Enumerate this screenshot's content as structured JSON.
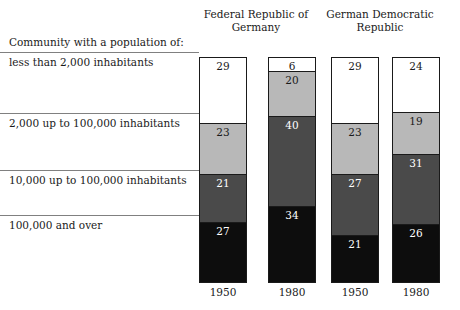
{
  "chart_data": {
    "type": "bar",
    "subtype": "stacked-column-100pct",
    "title": "",
    "xlabel": "",
    "ylabel": "",
    "ylim": [
      0,
      100
    ],
    "grid": false,
    "legend_position": "left-row-labels",
    "caption": "Community with a population of:",
    "group_headers": [
      "Federal Republic of\nGermany",
      "German Democratic\nRepublic"
    ],
    "categories": [
      "less than 2,000 inhabitants",
      "2,000 up to 100,000 inhabitants",
      "10,000 up to 100,000 inhabitants",
      "100,000 and over"
    ],
    "columns": [
      {
        "year": "1950",
        "group": "Federal Republic of Germany",
        "values": [
          29,
          23,
          21,
          27
        ]
      },
      {
        "year": "1980",
        "group": "Federal Republic of Germany",
        "values": [
          6,
          20,
          40,
          34
        ]
      },
      {
        "year": "1950",
        "group": "German Democratic Republic",
        "values": [
          29,
          23,
          27,
          21
        ]
      },
      {
        "year": "1980",
        "group": "German Democratic Republic",
        "values": [
          24,
          19,
          31,
          26
        ]
      }
    ],
    "series_colors": [
      "#ffffff",
      "#b8b8b8",
      "#4a4a4a",
      "#0d0d0d"
    ],
    "series_text_colors": [
      "#1a1a1a",
      "#1a1a1a",
      "#ffffff",
      "#ffffff"
    ]
  }
}
